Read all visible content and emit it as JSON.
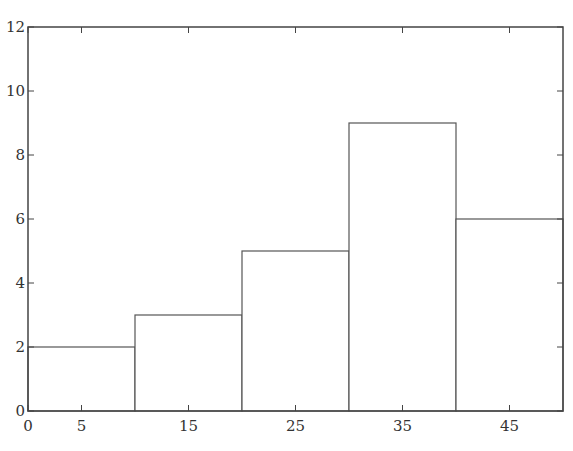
{
  "caption_fragment": "",
  "chart_data": {
    "type": "bar",
    "subtype": "histogram",
    "title": "",
    "xlabel": "",
    "ylabel": "",
    "bins": [
      [
        0,
        10
      ],
      [
        10,
        20
      ],
      [
        20,
        30
      ],
      [
        30,
        40
      ],
      [
        40,
        50
      ]
    ],
    "categories": [
      "0-10",
      "10-20",
      "20-30",
      "30-40",
      "40-50"
    ],
    "values": [
      2,
      3,
      5,
      9,
      6
    ],
    "xlim": [
      0,
      50
    ],
    "ylim": [
      0,
      12
    ],
    "xticks": [
      0,
      5,
      15,
      25,
      35,
      45
    ],
    "yticks": [
      0,
      2,
      4,
      6,
      8,
      10,
      12
    ],
    "grid": false,
    "legend": null,
    "bar_fill": "#ffffff",
    "bar_edge": "#555555"
  }
}
